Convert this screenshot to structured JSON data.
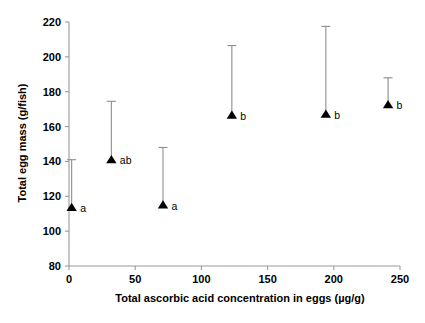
{
  "chart_data": {
    "type": "scatter",
    "title": "",
    "xlabel": "Total ascorbic acid concentration in eggs (µg/g)",
    "ylabel": "Total egg mass (g/fish)",
    "xlim": [
      0,
      250
    ],
    "ylim": [
      80,
      220
    ],
    "xticks": [
      0,
      50,
      100,
      150,
      200,
      250
    ],
    "yticks": [
      80,
      100,
      120,
      140,
      160,
      180,
      200,
      220
    ],
    "xtick_labels": [
      "0",
      "50",
      "100",
      "150",
      "200",
      "250"
    ],
    "ytick_labels": [
      "80",
      "100",
      "120",
      "140",
      "160",
      "180",
      "200",
      "220"
    ],
    "grid": false,
    "legend": false,
    "marker": "filled-triangle",
    "error_bars": "upper-only",
    "points": [
      {
        "x": 2,
        "y": 113.5,
        "error_upper": 141.0,
        "label": "a"
      },
      {
        "x": 32,
        "y": 141.0,
        "error_upper": 174.5,
        "label": "ab"
      },
      {
        "x": 71,
        "y": 115.0,
        "error_upper": 148.0,
        "label": "a"
      },
      {
        "x": 123,
        "y": 166.5,
        "error_upper": 206.5,
        "label": "b"
      },
      {
        "x": 194,
        "y": 167.0,
        "error_upper": 217.5,
        "label": "b"
      },
      {
        "x": 241,
        "y": 172.5,
        "error_upper": 188.0,
        "label": "b"
      }
    ]
  },
  "colors": {
    "marker": "#000000",
    "axis": "#9a9a9a",
    "error_bar": "#8d8d8d",
    "text": "#000000",
    "background": "#ffffff"
  }
}
